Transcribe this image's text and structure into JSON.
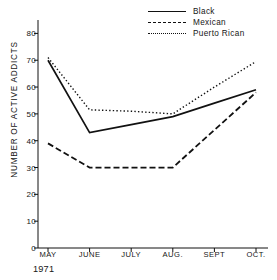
{
  "chart_data": {
    "type": "line",
    "title": "",
    "xlabel": "1971",
    "ylabel": "NUMBER OF ACTIVE ADDICTS",
    "categories": [
      "MAY",
      "JUNE",
      "JULY",
      "AUG.",
      "SEPT",
      "OCT."
    ],
    "yticks": [
      0,
      10,
      20,
      30,
      40,
      50,
      60,
      70,
      80
    ],
    "ylim": [
      0,
      85
    ],
    "grid": false,
    "legend_position": "top-right",
    "series": [
      {
        "name": "Black",
        "style": "solid",
        "color": "#111111",
        "values": [
          70,
          43,
          46,
          49,
          54,
          59
        ]
      },
      {
        "name": "Mexican",
        "style": "dashed",
        "color": "#111111",
        "values": [
          39,
          30,
          30,
          30,
          44,
          58
        ]
      },
      {
        "name": "Puerto Rican",
        "style": "dotted",
        "color": "#111111",
        "values": [
          71,
          51.5,
          51,
          50,
          60,
          69.5
        ]
      }
    ]
  },
  "axis": {
    "year_label": "1971"
  },
  "legend": {
    "items": [
      {
        "label": "Black"
      },
      {
        "label": "Mexican"
      },
      {
        "label": "Puerto Rican"
      }
    ]
  }
}
